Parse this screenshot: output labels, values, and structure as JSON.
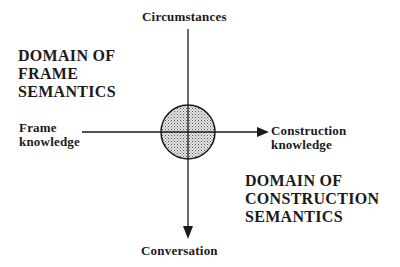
{
  "diagram": {
    "axes": {
      "top": "Circumstances",
      "bottom": "Conversation",
      "left": [
        "Frame",
        "knowledge"
      ],
      "right": [
        "Construction",
        "knowledge"
      ]
    },
    "domains": {
      "frame": [
        "DOMAIN OF",
        "FRAME",
        "SEMANTICS"
      ],
      "construction": [
        "DOMAIN OF",
        "CONSTRUCTION",
        "SEMANTICS"
      ]
    },
    "center": {
      "shape": "stippled-circle",
      "fill": "#c8c8c8"
    },
    "colors": {
      "line": "#1a1a1a",
      "text": "#1a1a1a",
      "background": "#ffffff"
    }
  }
}
